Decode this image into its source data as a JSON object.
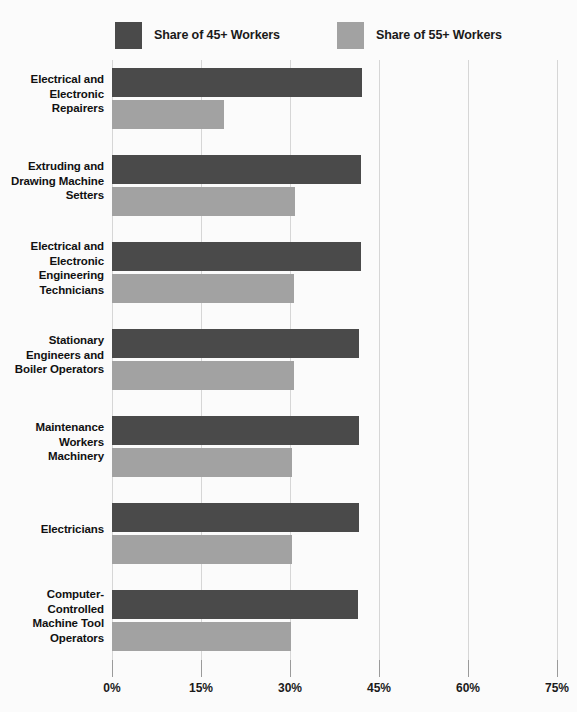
{
  "legend": {
    "items": [
      {
        "label": "Share of 45+ Workers",
        "color": "#4a4a4a",
        "key": "share_45_plus"
      },
      {
        "label": "Share of 55+ Workers",
        "color": "#a2a2a2",
        "key": "share_55_plus"
      }
    ]
  },
  "axis": {
    "tick_labels": [
      "0%",
      "15%",
      "30%",
      "45%",
      "60%",
      "75%"
    ],
    "tick_values": [
      0,
      15,
      30,
      45,
      60,
      75
    ]
  },
  "chart_data": {
    "type": "bar",
    "orientation": "horizontal",
    "title": "",
    "subtitle": "",
    "xlabel": "",
    "ylabel": "",
    "xlim": [
      0,
      75
    ],
    "xticks": [
      0,
      15,
      30,
      45,
      60,
      75
    ],
    "xtick_labels": [
      "0%",
      "15%",
      "30%",
      "45%",
      "60%",
      "75%"
    ],
    "grid": true,
    "grid_axis": "x",
    "legend_position": "top-left",
    "categories": [
      "Electrical and Electronic Repairers",
      "Extruding and Drawing Machine Setters",
      "Electrical and Electronic Engineering Technicians",
      "Stationary Engineers and Boiler Operators",
      "Maintenance Workers Machinery",
      "Electricians",
      "Computer-Controlled Machine Tool Operators"
    ],
    "category_lines": [
      [
        "Electrical and",
        "Electronic",
        "Repairers"
      ],
      [
        "Extruding and",
        "Drawing Machine",
        "Setters"
      ],
      [
        "Electrical and",
        "Electronic",
        "Engineering",
        "Technicians"
      ],
      [
        "Stationary",
        "Engineers and",
        "Boiler Operators"
      ],
      [
        "Maintenance",
        "Workers",
        "Machinery"
      ],
      [
        "Electricians"
      ],
      [
        "Computer-",
        "Controlled",
        "Machine Tool",
        "Operators"
      ]
    ],
    "series": [
      {
        "name": "Share of 45+ Workers",
        "key": "share_45_plus",
        "color": "#4a4a4a",
        "values": [
          42.1,
          42.0,
          41.9,
          41.7,
          41.6,
          41.6,
          41.5
        ]
      },
      {
        "name": "Share of 55+ Workers",
        "key": "share_55_plus",
        "color": "#a2a2a2",
        "values": [
          18.9,
          30.9,
          30.7,
          30.6,
          30.4,
          30.3,
          30.2
        ]
      }
    ]
  },
  "colors": {
    "background": "#fbfbfb",
    "primary": "#4a4a4a",
    "secondary": "#a2a2a2",
    "gridline": "#d6d6d6",
    "text": "#111111"
  }
}
